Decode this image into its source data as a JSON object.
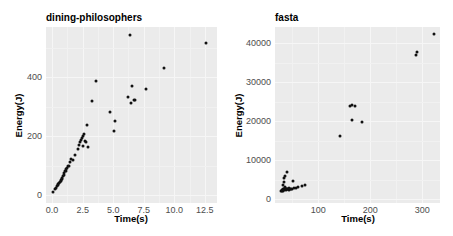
{
  "chart_data": [
    {
      "type": "scatter",
      "title": "dining-philosophers",
      "xlabel": "Time(s)",
      "ylabel": "Energy(J)",
      "xlim": [
        -0.5,
        13.5
      ],
      "ylim": [
        -27,
        570
      ],
      "xticks": [
        "0.0",
        "2.5",
        "5.0",
        "7.5",
        "10.0",
        "12.5"
      ],
      "xtick_values": [
        0,
        2.5,
        5,
        7.5,
        10,
        12.5
      ],
      "yticks": [
        "0",
        "200",
        "400"
      ],
      "ytick_values": [
        0,
        200,
        400
      ],
      "grid": true,
      "legend": null,
      "points": [
        [
          0.1,
          10
        ],
        [
          0.25,
          22
        ],
        [
          0.3,
          25
        ],
        [
          0.4,
          30
        ],
        [
          0.45,
          33
        ],
        [
          0.5,
          37
        ],
        [
          0.55,
          40
        ],
        [
          0.65,
          44
        ],
        [
          0.7,
          47
        ],
        [
          0.75,
          50
        ],
        [
          0.8,
          54
        ],
        [
          0.85,
          58
        ],
        [
          0.9,
          64
        ],
        [
          0.95,
          68
        ],
        [
          1.0,
          75
        ],
        [
          1.05,
          80
        ],
        [
          1.1,
          82
        ],
        [
          1.15,
          90
        ],
        [
          1.2,
          92
        ],
        [
          1.3,
          98
        ],
        [
          1.4,
          100
        ],
        [
          1.5,
          112
        ],
        [
          1.55,
          122
        ],
        [
          1.7,
          118
        ],
        [
          1.9,
          135
        ],
        [
          2.1,
          156
        ],
        [
          2.2,
          170
        ],
        [
          2.3,
          180
        ],
        [
          2.4,
          188
        ],
        [
          2.45,
          195
        ],
        [
          2.55,
          200
        ],
        [
          2.6,
          207
        ],
        [
          2.55,
          166
        ],
        [
          2.7,
          183
        ],
        [
          2.8,
          180
        ],
        [
          2.95,
          163
        ],
        [
          2.85,
          237
        ],
        [
          3.25,
          319
        ],
        [
          3.6,
          386
        ],
        [
          4.75,
          281
        ],
        [
          5.15,
          251
        ],
        [
          5.1,
          217
        ],
        [
          6.2,
          332
        ],
        [
          6.45,
          312
        ],
        [
          6.5,
          369
        ],
        [
          6.7,
          322
        ],
        [
          6.75,
          322
        ],
        [
          6.4,
          542
        ],
        [
          7.7,
          359
        ],
        [
          9.2,
          430
        ],
        [
          12.6,
          515
        ]
      ]
    },
    {
      "type": "scatter",
      "title": "fasta",
      "xlabel": "Time(s)",
      "ylabel": "Energy(J)",
      "xlim": [
        17,
        334
      ],
      "ylim": [
        -1000,
        44200
      ],
      "xticks": [
        "100",
        "200",
        "300"
      ],
      "xtick_values": [
        100,
        200,
        300
      ],
      "yticks": [
        "0",
        "10000",
        "20000",
        "30000",
        "40000"
      ],
      "ytick_values": [
        0,
        10000,
        20000,
        30000,
        40000
      ],
      "grid": true,
      "legend": null,
      "points": [
        [
          28,
          2100
        ],
        [
          30,
          2200
        ],
        [
          31,
          2300
        ],
        [
          32,
          2500
        ],
        [
          33,
          2200
        ],
        [
          34,
          2600
        ],
        [
          35,
          2400
        ],
        [
          36,
          2800
        ],
        [
          37,
          3100
        ],
        [
          38,
          2500
        ],
        [
          39,
          2300
        ],
        [
          40,
          2700
        ],
        [
          41,
          2500
        ],
        [
          42,
          2600
        ],
        [
          43,
          2400
        ],
        [
          44,
          2900
        ],
        [
          45,
          2500
        ],
        [
          47,
          2600
        ],
        [
          50,
          2700
        ],
        [
          53,
          2800
        ],
        [
          57,
          2900
        ],
        [
          62,
          3100
        ],
        [
          68,
          3400
        ],
        [
          74,
          3600
        ],
        [
          33,
          3700
        ],
        [
          35,
          4500
        ],
        [
          35,
          5500
        ],
        [
          37,
          6000
        ],
        [
          40,
          7000
        ],
        [
          52,
          4700
        ],
        [
          142,
          16200
        ],
        [
          162,
          23800
        ],
        [
          164,
          24200
        ],
        [
          170,
          24000
        ],
        [
          165,
          20400
        ],
        [
          184,
          19900
        ],
        [
          287,
          37000
        ],
        [
          290,
          37900
        ],
        [
          322,
          42500
        ]
      ]
    }
  ]
}
